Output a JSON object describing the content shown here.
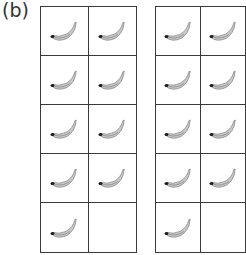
{
  "label": "(b)",
  "grids": [
    {
      "name": "ten-frame-left",
      "rows": 5,
      "cols": 2,
      "filled": [
        true,
        true,
        true,
        true,
        true,
        true,
        true,
        true,
        true,
        false
      ],
      "count": 9
    },
    {
      "name": "ten-frame-right",
      "rows": 5,
      "cols": 2,
      "filled": [
        true,
        true,
        true,
        true,
        true,
        true,
        true,
        true,
        true,
        false
      ],
      "count": 9
    }
  ],
  "icon": "banana-icon",
  "colors": {
    "line": "#3a3a3a",
    "banana": "#c8c8c8",
    "banana_shadow": "#8a8a8a",
    "banana_tip": "#1a1a1a"
  }
}
